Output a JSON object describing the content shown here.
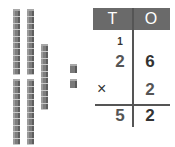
{
  "blocks": {
    "tens_rods": [
      {
        "id": "rod-1",
        "x": 13,
        "y": 11,
        "height": 64,
        "cubes": 10
      },
      {
        "id": "rod-2",
        "x": 27,
        "y": 11,
        "height": 64,
        "cubes": 10
      },
      {
        "id": "rod-3",
        "x": 41,
        "y": 46,
        "height": 64,
        "cubes": 10
      },
      {
        "id": "rod-4",
        "x": 13,
        "y": 81,
        "height": 64,
        "cubes": 10
      },
      {
        "id": "rod-5",
        "x": 27,
        "y": 81,
        "height": 64,
        "cubes": 10
      }
    ],
    "units": [
      {
        "id": "unit-1",
        "x": 70,
        "y": 66
      },
      {
        "id": "unit-2",
        "x": 70,
        "y": 81
      }
    ]
  },
  "table": {
    "headers": {
      "tens": "T",
      "ones": "O"
    },
    "carry": "1",
    "multiplicand": {
      "tens": "2",
      "ones": "6"
    },
    "operator": "×",
    "multiplier": {
      "ones": "2"
    },
    "result": {
      "tens": "5",
      "ones": "2"
    },
    "colors": {
      "header_bg": "#6a6a6a",
      "header_text": "#ffffff",
      "rule": "#555555"
    }
  }
}
